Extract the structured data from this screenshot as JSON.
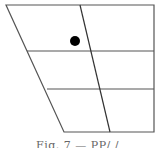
{
  "diagram": {
    "type": "vowel-quadrilateral",
    "stroke_color": "#555555",
    "dot_color": "#000000",
    "outline": {
      "top_left": [
        6,
        5
      ],
      "top_right": [
        154,
        5
      ],
      "bottom_right": [
        154,
        132
      ],
      "bottom_left": [
        64,
        132
      ]
    },
    "horizontal_lines": [
      {
        "x1": 27,
        "y": 51,
        "x2": 154
      },
      {
        "x1": 47,
        "y": 89,
        "x2": 154
      }
    ],
    "center_line": {
      "x1": 80,
      "y1": 5,
      "x2": 110,
      "y2": 132
    },
    "marker": {
      "cx": 75,
      "cy": 41,
      "r": 5
    }
  },
  "caption": "Fig. 7 — PP/ /"
}
